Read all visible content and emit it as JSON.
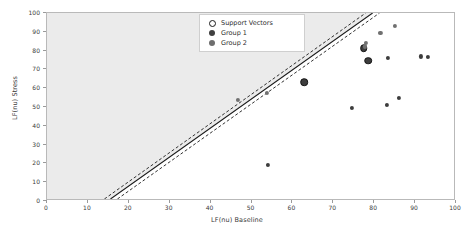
{
  "chart_data": {
    "type": "scatter",
    "title": "",
    "xlabel": "LF(nu) Baseline",
    "ylabel": "LF(nu) Stress",
    "xlim": [
      0,
      100
    ],
    "ylim": [
      0,
      100
    ],
    "xticks": [
      0,
      10,
      20,
      30,
      40,
      50,
      60,
      70,
      80,
      90,
      100
    ],
    "yticks": [
      0,
      10,
      20,
      30,
      40,
      50,
      60,
      70,
      80,
      90,
      100
    ],
    "grid": false,
    "legend_position": "upper center",
    "legend": [
      {
        "label": "Support Vectors",
        "marker": "open-circle",
        "color": "#1a1a1a"
      },
      {
        "label": "Group 1",
        "marker": "filled-circle",
        "color": "#3d3d3d"
      },
      {
        "label": "Group 2",
        "marker": "filled-circle",
        "color": "#707070"
      }
    ],
    "series": [
      {
        "name": "Group 1",
        "color": "#3d3d3d",
        "points": [
          {
            "x": 54.0,
            "y": 19.2
          },
          {
            "x": 74.5,
            "y": 49.4
          },
          {
            "x": 83.2,
            "y": 51.2
          },
          {
            "x": 86.0,
            "y": 54.8
          },
          {
            "x": 83.4,
            "y": 76.0
          },
          {
            "x": 91.5,
            "y": 76.9
          },
          {
            "x": 93.2,
            "y": 76.8
          },
          {
            "x": 78.6,
            "y": 74.6
          },
          {
            "x": 77.4,
            "y": 81.3
          }
        ]
      },
      {
        "name": "Group 2",
        "color": "#707070",
        "points": [
          {
            "x": 46.6,
            "y": 53.9
          },
          {
            "x": 53.8,
            "y": 57.5
          },
          {
            "x": 78.0,
            "y": 84.2
          },
          {
            "x": 81.5,
            "y": 89.5
          },
          {
            "x": 85.0,
            "y": 93.1
          },
          {
            "x": 77.8,
            "y": 82.2
          }
        ]
      }
    ],
    "support_vectors": [
      {
        "x": 62.9,
        "y": 63.3,
        "group": "Group 1"
      },
      {
        "x": 77.4,
        "y": 81.3,
        "group": "Group 1"
      },
      {
        "x": 78.6,
        "y": 74.6,
        "group": "Group 1"
      }
    ],
    "decision_boundary": {
      "style": "solid",
      "color": "#1a1a1a",
      "x_at_y0": 15.6,
      "x_at_y100": 80.0
    },
    "margins": [
      {
        "style": "dashed",
        "color": "#1a1a1a",
        "x_at_y0": 14.1,
        "x_at_y100": 78.3
      },
      {
        "style": "dashed",
        "color": "#1a1a1a",
        "x_at_y0": 17.3,
        "x_at_y100": 81.7
      }
    ],
    "shaded_region": {
      "side": "upper-left",
      "color": "#ebebeb",
      "description": "Shaded classification region left of the decision boundary"
    }
  }
}
